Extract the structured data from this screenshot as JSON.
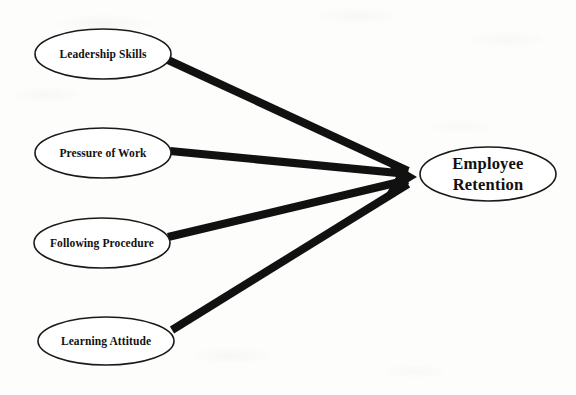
{
  "diagram": {
    "type": "path-model",
    "title": "",
    "background_color": "#fdfdfc",
    "line_color": "#111111",
    "node_fill": "#ffffff",
    "node_stroke": "#1a1a1a",
    "sources": [
      {
        "id": "leadership-skills",
        "label": "Leadership Skills",
        "cx": 103,
        "cy": 54,
        "rx": 68,
        "ry": 25,
        "line": {
          "x1": 168,
          "y1": 60,
          "x2": 408,
          "y2": 171
        }
      },
      {
        "id": "pressure-of-work",
        "label": "Pressure of Work",
        "cx": 103,
        "cy": 153,
        "rx": 68,
        "ry": 25,
        "line": {
          "x1": 170,
          "y1": 151,
          "x2": 408,
          "y2": 174
        }
      },
      {
        "id": "following-procedure",
        "label": "Following Procedure",
        "cx": 102,
        "cy": 243,
        "rx": 68,
        "ry": 25,
        "line": {
          "x1": 168,
          "y1": 237,
          "x2": 408,
          "y2": 180
        }
      },
      {
        "id": "learning-attitude",
        "label": "Learning Attitude",
        "cx": 106,
        "cy": 341,
        "rx": 68,
        "ry": 24,
        "line": {
          "x1": 172,
          "y1": 330,
          "x2": 408,
          "y2": 184
        }
      }
    ],
    "target": {
      "id": "employee-retention",
      "label_line1": "Employee",
      "label_line2": "Retention",
      "cx": 488,
      "cy": 174,
      "rx": 68,
      "ry": 27
    },
    "arrow": {
      "tip_x": 417,
      "tip_y": 177,
      "back_x": 385,
      "top_y": 158,
      "bottom_y": 196
    }
  }
}
